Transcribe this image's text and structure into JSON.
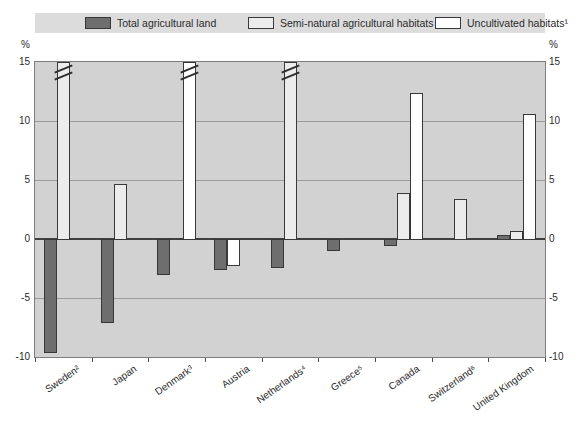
{
  "figure": {
    "unit_left": "%",
    "unit_right": "%"
  },
  "legend": {
    "items": [
      {
        "label": "Total agricultural land",
        "swatch": "dark"
      },
      {
        "label": "Semi-natural agricultural habitats",
        "swatch": "semi"
      },
      {
        "label": "Uncultivated habitats¹",
        "swatch": "white"
      }
    ]
  },
  "axes": {
    "y_ticks": [
      15,
      10,
      5,
      0,
      -5,
      -10
    ],
    "y_max": 15,
    "y_min": -10
  },
  "colors": {
    "plot_background": "#d2d2d2",
    "legend_background": "#dcdcdc",
    "gridline": "#9b9b9b",
    "zero_line": "#3f3f3f",
    "plot_border": "#7d7d7d",
    "bar_border": "#383838",
    "series_fills": {
      "dark": "#6e6e6e",
      "semi": "#ececec",
      "white": "#ffffff"
    },
    "text": "#2b2b2b"
  },
  "chart_data": {
    "type": "bar",
    "title": "",
    "ylabel": "%",
    "ylim": [
      -10,
      15
    ],
    "grid": true,
    "legend_position": "top",
    "categories": [
      "Sweden²",
      "Japan",
      "Denmark³",
      "Austria",
      "Netherlands⁴",
      "Greece⁵",
      "Canada",
      "Switzerland⁶",
      "United Kingdom"
    ],
    "series": [
      {
        "name": "Total agricultural land",
        "swatch": "dark",
        "values": [
          -9.6,
          -7.0,
          -3.0,
          -2.5,
          -2.4,
          -0.9,
          -0.5,
          null,
          0.3
        ],
        "off_scale": [
          false,
          false,
          false,
          false,
          false,
          false,
          false,
          false,
          false
        ]
      },
      {
        "name": "Semi-natural agricultural habitats",
        "swatch": "semi",
        "values": [
          15,
          4.7,
          null,
          null,
          15,
          null,
          3.9,
          3.4,
          0.7
        ],
        "off_scale": [
          true,
          false,
          false,
          false,
          true,
          false,
          false,
          false,
          false
        ]
      },
      {
        "name": "Uncultivated habitats¹",
        "swatch": "white",
        "values": [
          null,
          null,
          15,
          -2.2,
          null,
          null,
          12.4,
          null,
          10.6
        ],
        "off_scale": [
          false,
          false,
          true,
          false,
          false,
          false,
          false,
          false,
          false
        ]
      }
    ],
    "off_scale_note": "Bars flagged off_scale exceed the 15% axis maximum and are drawn full height with a break mark"
  },
  "layout": {
    "slot_overrides": [
      {
        "category_index": 3,
        "series_index": 2,
        "slot": 1
      }
    ]
  }
}
